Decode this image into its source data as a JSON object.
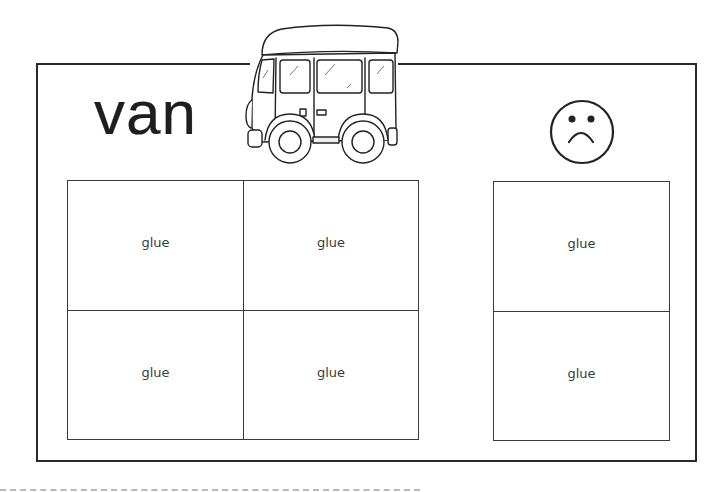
{
  "worksheet": {
    "word": "van",
    "picture": "van-illustration",
    "sad_icon": "sad-face-icon",
    "yes_boxes": [
      {
        "label": "glue"
      },
      {
        "label": "glue"
      },
      {
        "label": "glue"
      },
      {
        "label": "glue"
      }
    ],
    "no_boxes": [
      {
        "label": "glue"
      },
      {
        "label": "glue"
      }
    ],
    "cut_line": "dashed-cut-line"
  },
  "colors": {
    "ink": "#2a2a2a",
    "box_line": "#3a3a3a",
    "label": "#3c3c3c",
    "cut_line": "#b8b8b8",
    "background": "#ffffff"
  }
}
